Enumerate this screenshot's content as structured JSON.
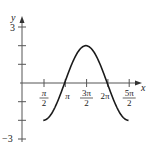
{
  "chart_data": {
    "type": "line",
    "title": "",
    "xlabel": "x",
    "ylabel": "y",
    "function": "y = -2 sin x",
    "xlim": [
      0.0,
      8.6
    ],
    "ylim": [
      -3,
      3
    ],
    "x_ticks": [
      {
        "value": 1.5708,
        "label_num": "π",
        "label_den": "2"
      },
      {
        "value": 3.1416,
        "label": "π"
      },
      {
        "value": 4.7124,
        "label_num": "3π",
        "label_den": "2"
      },
      {
        "value": 6.2832,
        "label": "2π"
      },
      {
        "value": 7.854,
        "label_num": "5π",
        "label_den": "2"
      }
    ],
    "y_ticks": [
      -3,
      -2,
      -1,
      1,
      2,
      3
    ],
    "y_tick_labels": {
      "3": "3",
      "-3": "−3"
    },
    "series": [
      {
        "name": "y = -2 sin x",
        "domain": [
          1.5708,
          7.854
        ],
        "points": [
          {
            "x": 1.5708,
            "y": -2
          },
          {
            "x": 3.1416,
            "y": 0
          },
          {
            "x": 4.7124,
            "y": 2
          },
          {
            "x": 6.2832,
            "y": 0
          },
          {
            "x": 7.854,
            "y": -2
          }
        ]
      }
    ],
    "grid": false,
    "legend": null
  },
  "labels": {
    "x_axis": "x",
    "y_axis": "y",
    "y_top": "3",
    "y_bottom": "−3",
    "pi": "π",
    "two_pi": "2π",
    "pi_num": "π",
    "three_pi_num": "3π",
    "five_pi_num": "5π",
    "den": "2"
  },
  "colors": {
    "axis": "#555555",
    "curve": "#1a1a1a",
    "text": "#222222"
  }
}
